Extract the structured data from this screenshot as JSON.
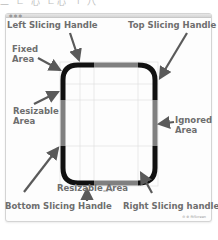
{
  "window": {
    "traffic_lights": "● ● ●",
    "status_text": "⊖ ⊕  fitScreen"
  },
  "top_cropped_text": "二 ㄴ 心  ㄷ心 ㄱ 八",
  "labels": {
    "left_slicing_handle": "Left Slicing Handle",
    "top_slicing_handle": "Top Slicing Handle",
    "fixed_area": [
      "Fixed",
      "Area"
    ],
    "resizable_area_left": [
      "Resizable",
      "Area"
    ],
    "ignored_area": [
      "Ignored",
      "Area"
    ],
    "resizable_area_bottom": "Resizable Area",
    "bottom_slicing_handle": "Bottom Slicing Handle",
    "right_slicing_handle": "Right Slicing handle"
  },
  "shape": {
    "bottom_caption": "wo · 2",
    "colors": {
      "fixed": "#111111",
      "resizable": "#808080",
      "arrow": "#5a5a5a",
      "label": "#6e6e6e",
      "grid": "#dddddd"
    }
  }
}
